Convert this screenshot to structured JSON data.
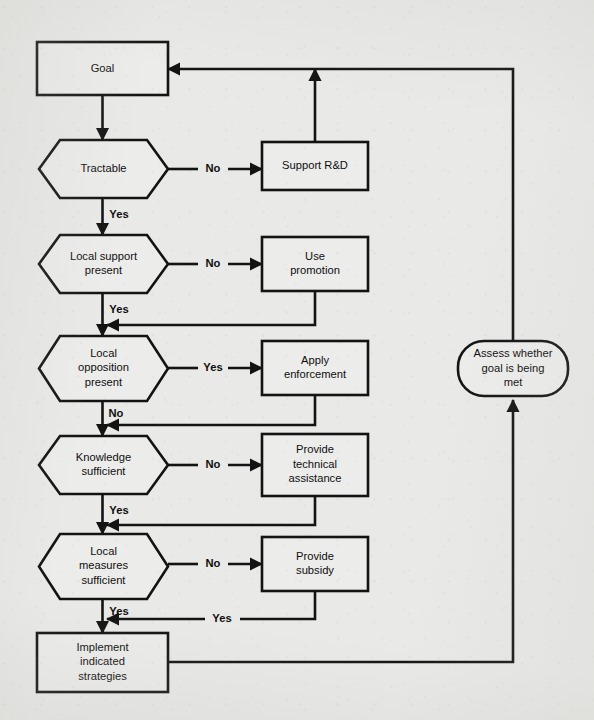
{
  "diagram": {
    "type": "flowchart",
    "background_color": "#e9e9e7",
    "line_color": "#131313",
    "node_fill": "#ececea",
    "nodes": [
      {
        "id": "goal",
        "shape": "rectangle",
        "lines": [
          "Goal"
        ],
        "x": 37,
        "y": 42,
        "w": 131,
        "h": 53
      },
      {
        "id": "tractable",
        "shape": "hexagon",
        "lines": [
          "Tractable"
        ],
        "x": 39,
        "y": 140,
        "w": 129,
        "h": 58
      },
      {
        "id": "support-rd",
        "shape": "rectangle",
        "lines": [
          "Support R&D"
        ],
        "x": 262,
        "y": 142,
        "w": 106,
        "h": 48
      },
      {
        "id": "local-support-present",
        "shape": "hexagon",
        "lines": [
          "Local support",
          "present"
        ],
        "x": 39,
        "y": 235,
        "w": 129,
        "h": 58
      },
      {
        "id": "use-promotion",
        "shape": "rectangle",
        "lines": [
          "Use",
          "promotion"
        ],
        "x": 262,
        "y": 237,
        "w": 106,
        "h": 54
      },
      {
        "id": "local-opposition-present",
        "shape": "hexagon",
        "lines": [
          "Local",
          "opposition",
          "present"
        ],
        "x": 39,
        "y": 336,
        "w": 129,
        "h": 65
      },
      {
        "id": "apply-enforcement",
        "shape": "rectangle",
        "lines": [
          "Apply",
          "enforcement"
        ],
        "x": 262,
        "y": 341,
        "w": 106,
        "h": 54
      },
      {
        "id": "knowledge-sufficient",
        "shape": "hexagon",
        "lines": [
          "Knowledge",
          "sufficient"
        ],
        "x": 39,
        "y": 436,
        "w": 129,
        "h": 58
      },
      {
        "id": "provide-technical-assistance",
        "shape": "rectangle",
        "lines": [
          "Provide",
          "technical",
          "assistance"
        ],
        "x": 262,
        "y": 434,
        "w": 106,
        "h": 62
      },
      {
        "id": "local-measures-sufficient",
        "shape": "hexagon",
        "lines": [
          "Local",
          "measures",
          "sufficient"
        ],
        "x": 39,
        "y": 534,
        "w": 129,
        "h": 65
      },
      {
        "id": "provide-subsidy",
        "shape": "rectangle",
        "lines": [
          "Provide",
          "subsidy"
        ],
        "x": 262,
        "y": 537,
        "w": 106,
        "h": 54
      },
      {
        "id": "implement-indicated-strategies",
        "shape": "rectangle",
        "lines": [
          "Implement",
          "indicated",
          "strategies"
        ],
        "x": 37,
        "y": 633,
        "w": 131,
        "h": 59
      },
      {
        "id": "assess-goal",
        "shape": "rounded",
        "lines": [
          "Assess whether",
          "goal is being",
          "met"
        ],
        "x": 458,
        "y": 341,
        "w": 110,
        "h": 55
      }
    ],
    "edge_labels": [
      {
        "id": "tractable-no",
        "text": "No",
        "x": 213,
        "y": 169
      },
      {
        "id": "tractable-yes",
        "text": "Yes",
        "x": 119,
        "y": 215
      },
      {
        "id": "local-support-no",
        "text": "No",
        "x": 213,
        "y": 264
      },
      {
        "id": "local-support-yes",
        "text": "Yes",
        "x": 119,
        "y": 310
      },
      {
        "id": "local-opposition-yes",
        "text": "Yes",
        "x": 213,
        "y": 368
      },
      {
        "id": "local-opposition-no",
        "text": "No",
        "x": 116,
        "y": 414
      },
      {
        "id": "knowledge-no",
        "text": "No",
        "x": 213,
        "y": 465
      },
      {
        "id": "knowledge-yes",
        "text": "Yes",
        "x": 119,
        "y": 511
      },
      {
        "id": "local-measures-no",
        "text": "No",
        "x": 213,
        "y": 564
      },
      {
        "id": "local-measures-yes",
        "text": "Yes",
        "x": 119,
        "y": 612
      },
      {
        "id": "subsidy-yes",
        "text": "Yes",
        "x": 222,
        "y": 619
      }
    ]
  }
}
